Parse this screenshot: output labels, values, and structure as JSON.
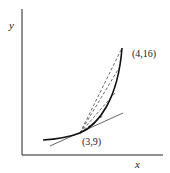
{
  "diagram": {
    "axes": {
      "x_label": "x",
      "y_label": "y"
    },
    "points": [
      {
        "label": "(3,9)"
      },
      {
        "label": "(4,16)"
      }
    ],
    "elements": [
      "curve y=x^2",
      "tangent line at (3,9)",
      "dashed secant lines from (3,9)"
    ]
  }
}
